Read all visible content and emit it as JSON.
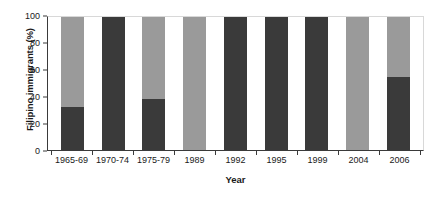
{
  "chart_data": {
    "type": "bar",
    "subtype": "stacked-bar-100-percent",
    "title": "",
    "xlabel": "Year",
    "ylabel": "Filipino immigrants (%)",
    "categories": [
      "1965-69",
      "1970-74",
      "1975-79",
      "1989",
      "1992",
      "1995",
      "1999",
      "2004",
      "2006"
    ],
    "series": [
      {
        "name": "dark-segment",
        "color": "#3a3a3a",
        "values": [
          32,
          100,
          38,
          0,
          100,
          100,
          100,
          0,
          55
        ]
      },
      {
        "name": "light-segment",
        "color": "#9a9a9a",
        "values": [
          68,
          0,
          62,
          100,
          0,
          0,
          0,
          100,
          45
        ]
      }
    ],
    "ylim": [
      0,
      100
    ],
    "yticks": [
      0,
      20,
      40,
      60,
      80,
      100
    ],
    "ytick_labels": [
      "0",
      "20",
      "40",
      "60",
      "80",
      "100"
    ],
    "grid": false,
    "legend": "none",
    "axis_color": "#3a3a3a",
    "background": "#ffffff"
  }
}
